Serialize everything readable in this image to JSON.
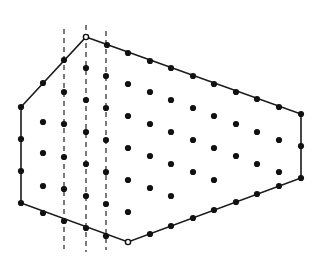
{
  "figure": {
    "type": "diagram",
    "width": 316,
    "height": 265,
    "background_color": "#ffffff",
    "edge_color": "#1a1a1a",
    "dot_color": "#111111",
    "cut_line_color": "#2b2b2b",
    "dot_radius": 3.1,
    "boundary_dot_radius": 3.1,
    "vertex_open_radius": 2.6,
    "edge_width": 1.6,
    "cut_line_width": 1.25,
    "cut_line_dash": "5 4"
  },
  "polygon": {
    "name": "hexagon-outline",
    "closed": true,
    "vertices": [
      {
        "label": "apex-top",
        "x": 86,
        "y": 37,
        "marker": "open"
      },
      {
        "label": "right-top",
        "x": 301,
        "y": 114,
        "marker": "filled"
      },
      {
        "label": "right-bottom",
        "x": 301,
        "y": 178,
        "marker": "filled"
      },
      {
        "label": "bottom",
        "x": 128,
        "y": 242,
        "marker": "open"
      },
      {
        "label": "left-bottom",
        "x": 21,
        "y": 203,
        "marker": "filled"
      },
      {
        "label": "left-top",
        "x": 21,
        "y": 107,
        "marker": "filled"
      }
    ]
  },
  "cut_lines": [
    {
      "label": "cut-line-1",
      "x": 64,
      "y1": 29,
      "y2": 249
    },
    {
      "label": "cut-line-2",
      "x": 86,
      "y1": 25,
      "y2": 252
    },
    {
      "label": "cut-line-3",
      "x": 106,
      "y1": 31,
      "y2": 250
    }
  ],
  "boundary_points": [
    {
      "x": 43,
      "y": 83
    },
    {
      "x": 64,
      "y": 60
    },
    {
      "x": 107,
      "y": 45
    },
    {
      "x": 128,
      "y": 53
    },
    {
      "x": 150,
      "y": 61
    },
    {
      "x": 171,
      "y": 68
    },
    {
      "x": 193,
      "y": 76
    },
    {
      "x": 214,
      "y": 84
    },
    {
      "x": 236,
      "y": 92
    },
    {
      "x": 257,
      "y": 99
    },
    {
      "x": 279,
      "y": 107
    },
    {
      "x": 301,
      "y": 146
    },
    {
      "x": 279,
      "y": 186
    },
    {
      "x": 257,
      "y": 194
    },
    {
      "x": 236,
      "y": 202
    },
    {
      "x": 214,
      "y": 210
    },
    {
      "x": 193,
      "y": 218
    },
    {
      "x": 171,
      "y": 226
    },
    {
      "x": 150,
      "y": 234
    },
    {
      "x": 106,
      "y": 236
    },
    {
      "x": 86,
      "y": 228
    },
    {
      "x": 64,
      "y": 221
    },
    {
      "x": 43,
      "y": 213
    },
    {
      "x": 21,
      "y": 139
    },
    {
      "x": 21,
      "y": 171
    }
  ],
  "interior_points": [
    {
      "x": 43,
      "y": 122
    },
    {
      "x": 43,
      "y": 153
    },
    {
      "x": 43,
      "y": 186
    },
    {
      "x": 64,
      "y": 92
    },
    {
      "x": 64,
      "y": 124
    },
    {
      "x": 64,
      "y": 157
    },
    {
      "x": 64,
      "y": 189
    },
    {
      "x": 86,
      "y": 68
    },
    {
      "x": 86,
      "y": 100
    },
    {
      "x": 86,
      "y": 132
    },
    {
      "x": 86,
      "y": 164
    },
    {
      "x": 86,
      "y": 196
    },
    {
      "x": 106,
      "y": 76
    },
    {
      "x": 106,
      "y": 108
    },
    {
      "x": 106,
      "y": 140
    },
    {
      "x": 106,
      "y": 172
    },
    {
      "x": 106,
      "y": 204
    },
    {
      "x": 128,
      "y": 84
    },
    {
      "x": 128,
      "y": 116
    },
    {
      "x": 128,
      "y": 148
    },
    {
      "x": 128,
      "y": 180
    },
    {
      "x": 128,
      "y": 212
    },
    {
      "x": 150,
      "y": 92
    },
    {
      "x": 150,
      "y": 124
    },
    {
      "x": 150,
      "y": 156
    },
    {
      "x": 150,
      "y": 188
    },
    {
      "x": 171,
      "y": 100
    },
    {
      "x": 171,
      "y": 132
    },
    {
      "x": 171,
      "y": 164
    },
    {
      "x": 171,
      "y": 196
    },
    {
      "x": 193,
      "y": 108
    },
    {
      "x": 193,
      "y": 140
    },
    {
      "x": 193,
      "y": 172
    },
    {
      "x": 214,
      "y": 116
    },
    {
      "x": 214,
      "y": 148
    },
    {
      "x": 214,
      "y": 180
    },
    {
      "x": 236,
      "y": 124
    },
    {
      "x": 236,
      "y": 156
    },
    {
      "x": 257,
      "y": 132
    },
    {
      "x": 257,
      "y": 164
    },
    {
      "x": 279,
      "y": 140
    },
    {
      "x": 279,
      "y": 172
    }
  ]
}
